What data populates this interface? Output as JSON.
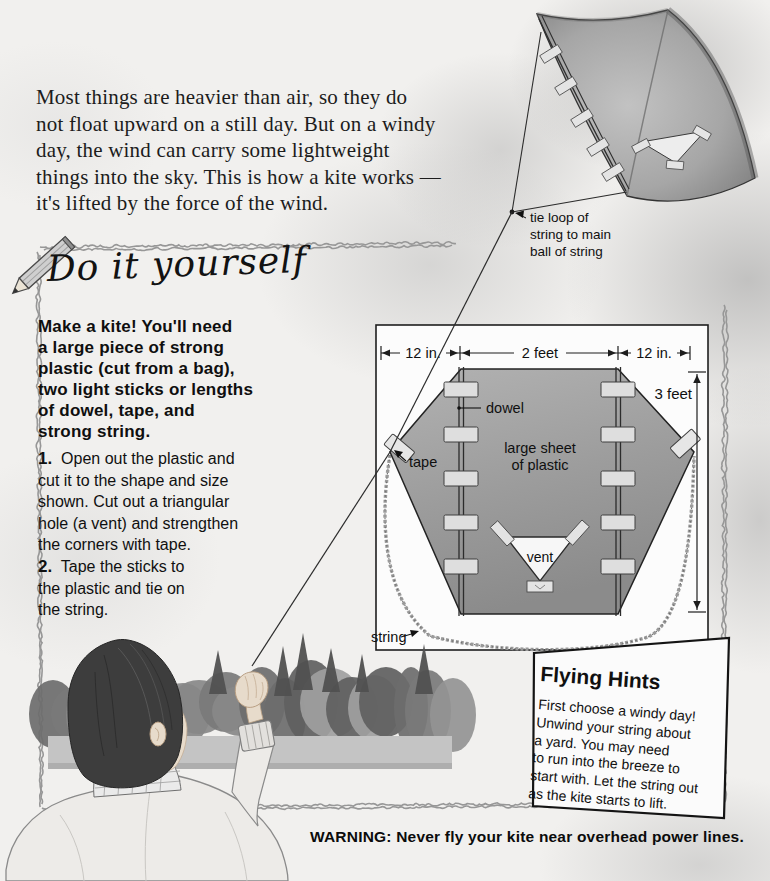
{
  "intro": {
    "lines": [
      "Most things are heavier than air, so they do",
      "not float upward on a still day. But on a windy",
      "day, the wind can carry some lightweight",
      "things into the sky. This is how a kite works —",
      "it's lifted by the force of the wind."
    ]
  },
  "flying_kite": {
    "tie_label_lines": [
      "tie loop of",
      "string to main",
      "ball of string"
    ]
  },
  "diy_panel": {
    "heading": "Do it yourself",
    "materials_lines": [
      "Make a kite! You'll need",
      "a large piece of strong",
      "plastic (cut from a bag),",
      "two light sticks or lengths",
      "of dowel, tape, and",
      "strong string."
    ],
    "steps": [
      {
        "number": "1.",
        "lines": [
          "Open out the plastic and",
          "cut it to the shape and size",
          "shown. Cut out a triangular",
          "hole (a vent) and strengthen",
          "the corners with tape."
        ]
      },
      {
        "number": "2.",
        "lines": [
          "Tape the sticks to",
          "the plastic and tie on",
          "the string."
        ]
      }
    ]
  },
  "diagram": {
    "dim_left": "12 in.",
    "dim_middle": "2 feet",
    "dim_right": "12 in.",
    "dim_height": "3 feet",
    "label_dowel": "dowel",
    "label_plastic_line1": "large sheet",
    "label_plastic_line2": "of plastic",
    "label_tape": "tape",
    "label_vent": "vent",
    "label_string": "string"
  },
  "flying_hints": {
    "title": "Flying Hints",
    "body_lines": [
      "First choose a windy day!",
      "Unwind your string about",
      "a yard. You may need",
      "to run into the breeze to",
      "start with. Let the string out",
      "as the kite starts to lift."
    ]
  },
  "warning": {
    "text": "WARNING: Never fly your kite near overhead power lines."
  },
  "colors": {
    "plastic_gray": "#9b9b9b",
    "page_ink": "#1a1a1a",
    "cloud_gray": "#bdbdbd"
  }
}
